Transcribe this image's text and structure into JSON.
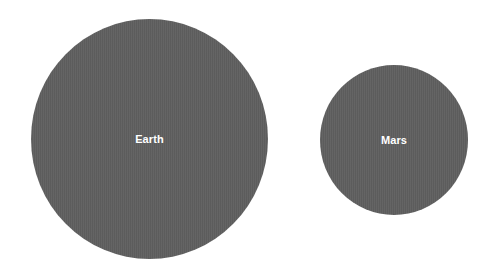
{
  "diagram": {
    "type": "size-comparison",
    "planets": [
      {
        "name": "Earth",
        "fill_color": "#5f5f5f",
        "label_color": "#ffffff"
      },
      {
        "name": "Mars",
        "fill_color": "#5f5f5f",
        "label_color": "#ffffff"
      }
    ],
    "background_color": "#ffffff"
  }
}
